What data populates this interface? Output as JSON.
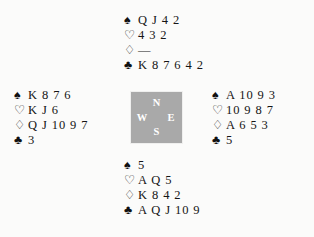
{
  "diagram": {
    "type": "bridge-deal-diagram",
    "background_color": "#fbfbfa",
    "text_color": "#151515",
    "suit_symbols": {
      "spades": "♠",
      "hearts": "♡",
      "diamonds": "♢",
      "clubs": "♣"
    },
    "void_marker": "—",
    "compass": {
      "box_color": "#a9a9a9",
      "letter_color": "#ffffff",
      "north": "N",
      "west": "W",
      "east": "E",
      "south": "S"
    },
    "hands": {
      "north": {
        "position_label": "North",
        "spades": "Q J 4 2",
        "hearts": "4 3 2",
        "diamonds": "—",
        "clubs": "K 8 7 6 4 2"
      },
      "west": {
        "position_label": "West",
        "spades": "K 8 7 6",
        "hearts": "K J 6",
        "diamonds": "Q J 10 9 7",
        "clubs": "3"
      },
      "east": {
        "position_label": "East",
        "spades": "A 10 9 3",
        "hearts": "10 9 8 7",
        "diamonds": "A 6 5 3",
        "clubs": "5"
      },
      "south": {
        "position_label": "South",
        "spades": "5",
        "hearts": "A Q 5",
        "diamonds": "K 8 4 2",
        "clubs": "A Q J 10 9"
      }
    }
  }
}
